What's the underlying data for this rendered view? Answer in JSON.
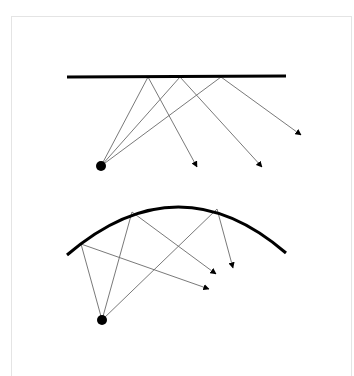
{
  "diagram": {
    "colors": {
      "mirror": "#000000",
      "ray": "#6a6a6a",
      "source": "#000000",
      "frame": "#e4e4e4",
      "background": "#ffffff"
    },
    "flat_mirror_panel": {
      "mirror": {
        "type": "line",
        "x1": 67,
        "y1": 77,
        "x2": 286,
        "y2": 76
      },
      "source": {
        "cx": 101,
        "cy": 166,
        "r": 5
      },
      "rays": [
        {
          "hit": [
            148,
            77
          ],
          "end": [
            197,
            167
          ]
        },
        {
          "hit": [
            180,
            77
          ],
          "end": [
            262,
            167
          ]
        },
        {
          "hit": [
            221,
            77
          ],
          "end": [
            301,
            135
          ]
        }
      ]
    },
    "curved_mirror_panel": {
      "mirror": {
        "type": "arc",
        "path": "M67,255 Q178,160 286,253"
      },
      "source": {
        "cx": 102,
        "cy": 320,
        "r": 5
      },
      "rays": [
        {
          "hit": [
            81,
            244
          ],
          "end": [
            209,
            289
          ]
        },
        {
          "hit": [
            132,
            212
          ],
          "end": [
            216,
            274
          ]
        },
        {
          "hit": [
            217,
            209
          ],
          "end": [
            233,
            268
          ]
        }
      ]
    }
  }
}
